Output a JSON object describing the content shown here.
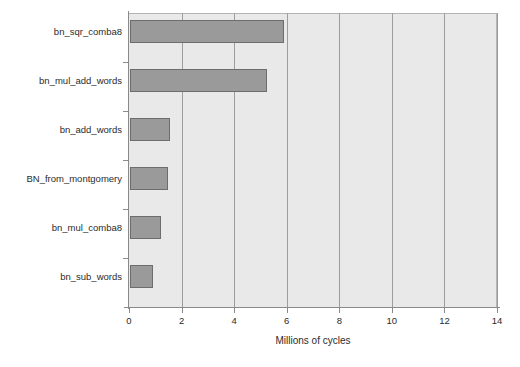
{
  "chart_data": {
    "type": "bar",
    "orientation": "horizontal",
    "title": "",
    "xlabel": "Millions of cycles",
    "ylabel": "",
    "categories": [
      "bn_sqr_comba8",
      "bn_mul_add_words",
      "bn_add_words",
      "BN_from_montgomery",
      "bn_mul_comba8",
      "bn_sub_words"
    ],
    "values": [
      5.85,
      5.2,
      1.52,
      1.45,
      1.18,
      0.87
    ],
    "xlim": [
      0,
      14
    ],
    "xticks": [
      0,
      2,
      4,
      6,
      8,
      10,
      12,
      14
    ],
    "xtick_labels": [
      "0",
      "2",
      "4",
      "6",
      "8",
      "10",
      "12",
      "14"
    ],
    "grid": "vertical",
    "legend": null,
    "colors": {
      "bar_fill": "#9a9a9a",
      "bar_edge": "#6d6d6d",
      "plot_background": "#e9e9e9",
      "gridline": "#9d9d9d",
      "axis": "#8a8a8a",
      "text": "#2b2b2b",
      "page_background": "#ffffff"
    }
  }
}
